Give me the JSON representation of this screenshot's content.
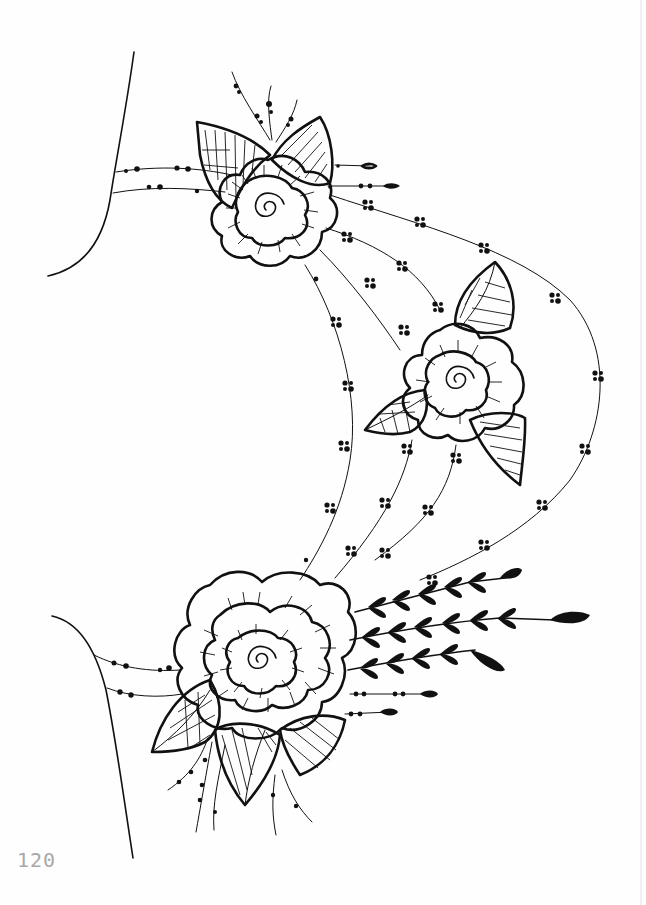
{
  "page": {
    "number": "120",
    "background": "#fefefe",
    "ink_color": "#111111",
    "page_number_color": "#a8a8a8"
  },
  "illustration": {
    "subject": "henna-style floral hand design",
    "elements": [
      {
        "name": "top-rose",
        "type": "rose",
        "center": [
          266,
          205
        ]
      },
      {
        "name": "middle-rose",
        "type": "rose",
        "center": [
          458,
          378
        ]
      },
      {
        "name": "bottom-rose",
        "type": "rose",
        "center": [
          262,
          655
        ]
      },
      {
        "name": "fern-sprigs",
        "type": "leaf-vine",
        "count": 3
      },
      {
        "name": "top-hand-outline",
        "type": "outline"
      },
      {
        "name": "bottom-hand-outline",
        "type": "outline"
      },
      {
        "name": "dotted-strands",
        "type": "beaded-lines"
      }
    ]
  }
}
